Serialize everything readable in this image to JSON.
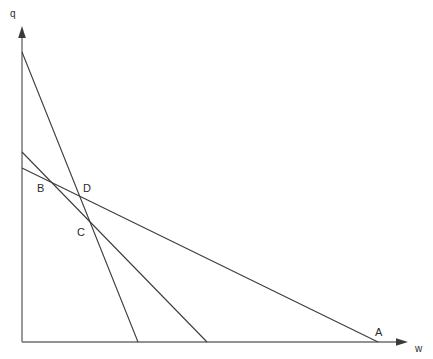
{
  "figure": {
    "background_color": "#ffffff",
    "width": 433,
    "height": 359,
    "line_color": "#3c3c3c",
    "axis_color": "#6e6e6e",
    "text_color": "#2b2b2b"
  },
  "axes": {
    "origin": [
      22,
      342
    ],
    "y_axis": {
      "label": "q",
      "label_pos": [
        10,
        9
      ],
      "from": [
        22,
        342
      ],
      "to": [
        22,
        30
      ],
      "arrow_tip": [
        22,
        26
      ]
    },
    "x_axis": {
      "label": "w",
      "label_pos": [
        415,
        344
      ],
      "from": [
        22,
        342
      ],
      "to": [
        400,
        342
      ],
      "arrow_tip": [
        408,
        342
      ]
    }
  },
  "chart_data": {
    "type": "line",
    "title": "",
    "xlabel": "w",
    "ylabel": "q",
    "xlim": [
      22,
      408
    ],
    "ylim": [
      342,
      28
    ],
    "grid": false,
    "legend": null,
    "series": [
      {
        "name": "steep-line",
        "x": [
          22,
          138
        ],
        "y": [
          52,
          342
        ],
        "y_intercept": 52,
        "x_intercept": 138
      },
      {
        "name": "medium-line",
        "x": [
          22,
          207
        ],
        "y": [
          152,
          342
        ],
        "y_intercept": 152,
        "x_intercept": 207
      },
      {
        "name": "shallow-line",
        "x": [
          22,
          378
        ],
        "y": [
          168,
          342
        ],
        "y_intercept": 168,
        "x_intercept": 378
      }
    ],
    "annotations": [
      {
        "text": "A",
        "x": 378,
        "y": 342,
        "label_pos": [
          375,
          327
        ]
      },
      {
        "text": "B",
        "x": 58,
        "y": 188,
        "label_pos": [
          37,
          183
        ]
      },
      {
        "text": "C",
        "x": 88,
        "y": 222,
        "label_pos": [
          77,
          227
        ]
      },
      {
        "text": "D",
        "x": 80,
        "y": 193,
        "label_pos": [
          83,
          183
        ]
      }
    ]
  },
  "labels": {
    "q": "q",
    "w": "w",
    "A": "A",
    "B": "B",
    "C": "C",
    "D": "D"
  }
}
